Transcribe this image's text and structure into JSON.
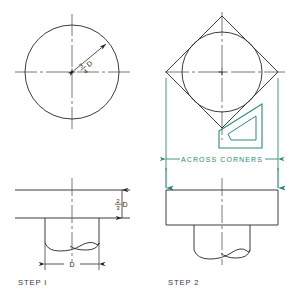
{
  "drawing": {
    "title": "Two-step square-across-corners layout construction",
    "background_color": "#ffffff",
    "line_color": "#262626",
    "accent_color": "#2f8a72",
    "centerline_color": "#555555"
  },
  "steps": [
    {
      "id": "step-1",
      "label": "STEP I",
      "plan_view": {
        "shape": "circle",
        "radius_dimension": {
          "numerator": "3",
          "denominator": "4",
          "suffix": "D",
          "text": "3/4 D",
          "rotation_deg": -40
        }
      },
      "elevation_view": {
        "thickness_dimension": {
          "numerator": "2",
          "denominator": "3",
          "suffix": "D",
          "text": "2/3 D"
        },
        "width_dimension": {
          "text": "D"
        },
        "feature": "drilled-hole-with-point"
      }
    },
    {
      "id": "step-2",
      "label": "STEP 2",
      "plan_view": {
        "shape": "square-across-corners-over-circle",
        "tool_overlay": "45-degree-set-square",
        "dimension": {
          "text": "ACROSS CORNERS",
          "color": "#2f8a72"
        }
      },
      "elevation_view": {
        "feature": "drilled-hole-with-point",
        "extension_line_color": "#2f8a72"
      }
    }
  ],
  "labels": {
    "across_corners": "ACROSS CORNERS",
    "step_one": "STEP I",
    "step_two": "STEP 2",
    "dim_d": "D",
    "frac_two": "2",
    "frac_three_den": "3",
    "frac_three": "3",
    "frac_four": "4",
    "suffix_d": "D"
  }
}
